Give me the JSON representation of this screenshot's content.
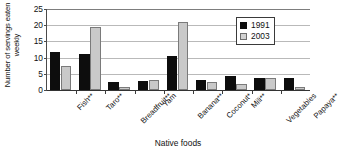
{
  "chart_data": {
    "type": "bar",
    "title": "",
    "xlabel": "Native foods",
    "ylabel": "Number of servings eaten weekly",
    "ylim": [
      0,
      25
    ],
    "yticks": [
      0,
      5,
      10,
      15,
      20,
      25
    ],
    "grid": true,
    "legend_position": "top-right",
    "categories": [
      "Fish**",
      "Taro**",
      "Breadfruit**",
      "Yam",
      "Banana**",
      "Coconut*",
      "Mili**",
      "Vegetables",
      "Papaya**"
    ],
    "series": [
      {
        "name": "1991",
        "color": "#0d0d0d",
        "values": [
          11.8,
          11.0,
          2.5,
          2.8,
          10.5,
          3.1,
          4.2,
          3.8,
          3.7
        ]
      },
      {
        "name": "2003",
        "color": "#c9c9c9",
        "values": [
          7.4,
          19.3,
          0.8,
          3.0,
          21.0,
          2.4,
          1.9,
          3.6,
          1.0
        ]
      }
    ]
  },
  "legend": {
    "entries": [
      {
        "label": "1991"
      },
      {
        "label": "2003"
      }
    ]
  }
}
